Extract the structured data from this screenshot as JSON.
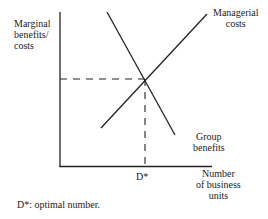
{
  "diagram": {
    "y_axis_label_lines": [
      "Marginal",
      "benefits/",
      "costs"
    ],
    "x_axis_label_lines": [
      "Number",
      "of business",
      "units"
    ],
    "curves": [
      {
        "name": "Managerial costs",
        "label_lines": [
          "Managerial",
          "costs"
        ],
        "slope": "upward",
        "from": [
          101,
          128
        ],
        "to": [
          207,
          14
        ]
      },
      {
        "name": "Group benefits",
        "label_lines": [
          "Group",
          "benefits"
        ],
        "slope": "downward",
        "from": [
          107,
          12
        ],
        "to": [
          175,
          135
        ]
      }
    ],
    "intersection": {
      "x_label": "D*",
      "point": [
        145,
        79
      ]
    },
    "guides": {
      "style": "dashed",
      "horizontal_to_y_axis": true,
      "vertical_to_x_axis": true
    },
    "footnote": "D*: optimal number."
  },
  "labels": {
    "y1": "Marginal",
    "y2": "benefits/",
    "y3": "costs",
    "mc1": "Managerial",
    "mc2": "costs",
    "gb1": "Group",
    "gb2": "benefits",
    "x1": "Number",
    "x2": "of business",
    "x3": "units",
    "dstar": "D*",
    "footnote": "D*: optimal number."
  }
}
